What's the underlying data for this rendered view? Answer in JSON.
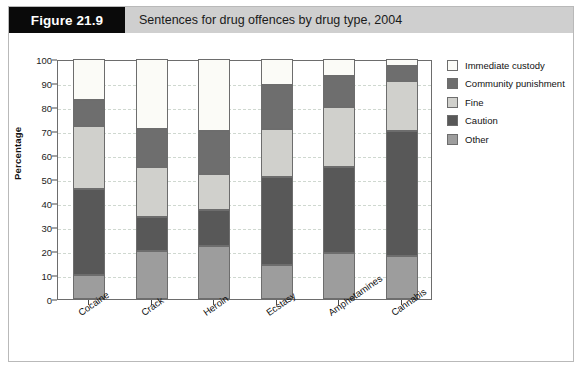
{
  "figure": {
    "tag": "Figure 21.9",
    "title": "Sentences for drug offences by drug type, 2004"
  },
  "colors": {
    "immediate_custody": "#fbfbf7",
    "community_punishment": "#6e6e6e",
    "fine": "#d0d0cc",
    "caution": "#585858",
    "other": "#9d9d9d",
    "axis": "#6d6d6d",
    "grid": "#cfd8d0",
    "header_bar": "#cfcfcf",
    "tag_bg": "#0a0a0a"
  },
  "chart_data": {
    "type": "bar",
    "stacked": true,
    "title": "Sentences for drug offences by drug type, 2004",
    "xlabel": "",
    "ylabel": "Percentage",
    "ylim": [
      0,
      100
    ],
    "yticks": [
      0,
      10,
      20,
      30,
      40,
      50,
      60,
      70,
      80,
      90,
      100
    ],
    "ytick_labels": [
      "0",
      "10",
      "20",
      "30",
      "40",
      "50",
      "60",
      "70",
      "80",
      "90",
      "100"
    ],
    "grid": true,
    "legend_position": "right",
    "categories": [
      "Cocaine",
      "Crack",
      "Heroin",
      "Ecstasy",
      "Amphetamines",
      "Cannabis"
    ],
    "series": [
      {
        "name": "Other",
        "values": [
          10,
          20,
          22,
          14,
          19,
          18
        ]
      },
      {
        "name": "Caution",
        "values": [
          36,
          14,
          15,
          37,
          36,
          52
        ]
      },
      {
        "name": "Fine",
        "values": [
          26,
          21,
          15,
          20,
          25,
          21
        ]
      },
      {
        "name": "Community punishment",
        "values": [
          11,
          16,
          18,
          18,
          13,
          6
        ]
      },
      {
        "name": "Immediate custody",
        "values": [
          17,
          29,
          30,
          11,
          7,
          3
        ]
      }
    ],
    "cumulative_tops": {
      "Cocaine": {
        "Other": 10,
        "Caution": 46,
        "Fine": 72,
        "Community punishment": 83,
        "Immediate custody": 100
      },
      "Crack": {
        "Other": 20,
        "Caution": 34,
        "Fine": 55,
        "Community punishment": 71,
        "Immediate custody": 100
      },
      "Heroin": {
        "Other": 22,
        "Caution": 37,
        "Fine": 52,
        "Community punishment": 70,
        "Immediate custody": 100
      },
      "Ecstasy": {
        "Other": 14,
        "Caution": 51,
        "Fine": 71,
        "Community punishment": 89,
        "Immediate custody": 100
      },
      "Amphetamines": {
        "Other": 19,
        "Caution": 55,
        "Fine": 80,
        "Community punishment": 93,
        "Immediate custody": 100
      },
      "Cannabis": {
        "Other": 18,
        "Caution": 70,
        "Fine": 91,
        "Community punishment": 97,
        "Immediate custody": 100
      }
    }
  },
  "legend": {
    "items": [
      {
        "label": "Immediate custody",
        "color": "#fbfbf7"
      },
      {
        "label": "Community punishment",
        "color": "#6e6e6e"
      },
      {
        "label": "Fine",
        "color": "#d0d0cc"
      },
      {
        "label": "Caution",
        "color": "#585858"
      },
      {
        "label": "Other",
        "color": "#9d9d9d"
      }
    ]
  }
}
